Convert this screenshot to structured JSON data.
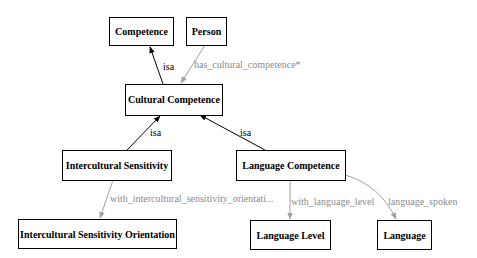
{
  "diagram": {
    "colors": {
      "node_border": "#000000",
      "isa_edge": "#000000",
      "property_edge": "#a0a0a0",
      "property_label": "#8a8a8a"
    },
    "nodes": {
      "competence": {
        "label": "Competence"
      },
      "person": {
        "label": "Person"
      },
      "cultural_competence": {
        "label": "Cultural Competence"
      },
      "intercultural_sensitivity": {
        "label": "Intercultural Sensitivity"
      },
      "language_competence": {
        "label": "Language Competence"
      },
      "intercultural_sensitivity_orientation": {
        "label": "Intercultural Sensitivity Orientation"
      },
      "language_level": {
        "label": "Language Level"
      },
      "language": {
        "label": "Language"
      }
    },
    "edges": {
      "cc_isa_competence": {
        "label": "isa",
        "type": "isa",
        "from": "Cultural Competence",
        "to": "Competence"
      },
      "person_has_cc": {
        "label": "has_cultural_competence*",
        "type": "property",
        "from": "Person",
        "to": "Cultural Competence"
      },
      "is_isa_cc": {
        "label": "isa",
        "type": "isa",
        "from": "Intercultural Sensitivity",
        "to": "Cultural Competence"
      },
      "lc_isa_cc": {
        "label": "isa",
        "type": "isa",
        "from": "Language Competence",
        "to": "Cultural Competence"
      },
      "is_with_iso": {
        "label": "with_intercultural_sensitivity_orientati...",
        "type": "property",
        "from": "Intercultural Sensitivity",
        "to": "Intercultural Sensitivity Orientation"
      },
      "lc_with_ll": {
        "label": "with_language_level",
        "type": "property",
        "from": "Language Competence",
        "to": "Language Level"
      },
      "lc_spoken": {
        "label": "language_spoken",
        "type": "property",
        "from": "Language Competence",
        "to": "Language"
      }
    }
  }
}
